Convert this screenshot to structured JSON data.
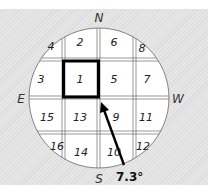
{
  "diagram": {
    "type": "compass-grid-map",
    "directions": {
      "north": "N",
      "south": "S",
      "east": "E",
      "west": "W"
    },
    "highlighted_cell": "1",
    "cells": [
      {
        "id": "4",
        "label": "4",
        "x": 51,
        "y": 50
      },
      {
        "id": "2",
        "label": "2",
        "x": 80,
        "y": 46
      },
      {
        "id": "6",
        "label": "6",
        "x": 114,
        "y": 46
      },
      {
        "id": "8",
        "label": "8",
        "x": 142,
        "y": 52
      },
      {
        "id": "3",
        "label": "3",
        "x": 41,
        "y": 83
      },
      {
        "id": "1",
        "label": "1",
        "x": 80,
        "y": 83
      },
      {
        "id": "5",
        "label": "5",
        "x": 114,
        "y": 83
      },
      {
        "id": "7",
        "label": "7",
        "x": 147,
        "y": 83
      },
      {
        "id": "15",
        "label": "15",
        "x": 47,
        "y": 121
      },
      {
        "id": "13",
        "label": "13",
        "x": 80,
        "y": 121
      },
      {
        "id": "9",
        "label": "9",
        "x": 116,
        "y": 121
      },
      {
        "id": "11",
        "label": "11",
        "x": 146,
        "y": 121
      },
      {
        "id": "16",
        "label": "16",
        "x": 57,
        "y": 150
      },
      {
        "id": "14",
        "label": "14",
        "x": 81,
        "y": 156
      },
      {
        "id": "10",
        "label": "10",
        "x": 114,
        "y": 156
      },
      {
        "id": "12",
        "label": "12",
        "x": 143,
        "y": 150
      }
    ],
    "arrow": {
      "label": "7.3°",
      "from": "S",
      "to": "cell-1-corner"
    }
  }
}
